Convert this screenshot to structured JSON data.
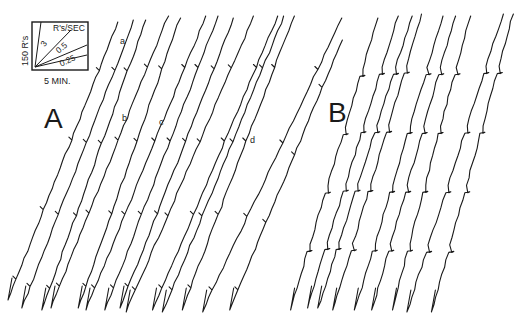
{
  "figure": {
    "panels": [
      {
        "label": "A",
        "curve_labels": [
          "a",
          "b",
          "c",
          "d"
        ]
      },
      {
        "label": "B"
      }
    ],
    "key": {
      "y_label": "150 R's",
      "x_label": "5 MIN.",
      "rate_title": "R's/SEC",
      "rates": [
        "3",
        "0.5",
        "0.25"
      ]
    }
  },
  "chart_data": {
    "type": "line",
    "title": "",
    "xlabel": "5 MIN.",
    "ylabel": "150 R's",
    "legend": [
      "R's/SEC: 3",
      "0.5",
      "0.25"
    ],
    "panels": [
      {
        "name": "A",
        "annotations": [
          "a",
          "b",
          "c",
          "d"
        ],
        "records": 13
      },
      {
        "name": "B",
        "records": 9
      }
    ]
  }
}
